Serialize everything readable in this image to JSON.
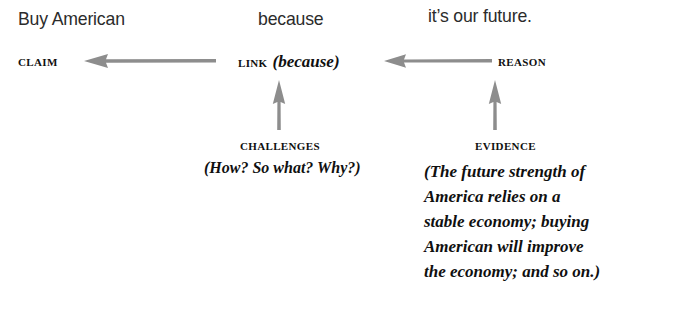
{
  "diagram": {
    "type": "argument-structure",
    "background_color": "#ffffff",
    "arrow_color": "#8d8d8d",
    "text_color": "#101010",
    "annotation_color": "#2b2b2b",
    "annotations": [
      {
        "id": "claim-annot",
        "text": "Buy American"
      },
      {
        "id": "link-annot",
        "text": "because"
      },
      {
        "id": "reason-annot",
        "text": "it’s our future."
      }
    ],
    "nodes": {
      "claim": {
        "label": "CLAIM"
      },
      "link": {
        "label": "LINK",
        "parenthetical": "(because)"
      },
      "reason": {
        "label": "REASON"
      },
      "challenges": {
        "label": "CHALLENGES",
        "parenthetical": "(How? So what? Why?)"
      },
      "evidence": {
        "label": "EVIDENCE",
        "parenthetical_lines": [
          "(The future strength of",
          "America relies on a",
          "stable economy; buying",
          "American will improve",
          "the economy; and so on.)"
        ]
      }
    },
    "arrows": [
      {
        "id": "reason-to-link",
        "direction": "left"
      },
      {
        "id": "link-to-claim",
        "direction": "left"
      },
      {
        "id": "challenges-to-link",
        "direction": "up"
      },
      {
        "id": "evidence-to-reason",
        "direction": "up"
      }
    ]
  }
}
